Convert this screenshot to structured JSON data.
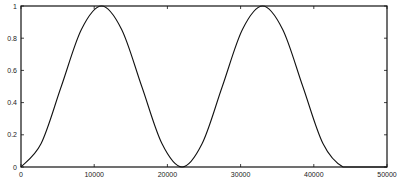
{
  "chart_data": {
    "type": "line",
    "title": "",
    "xlabel": "",
    "ylabel": "",
    "xlim": [
      0,
      50000
    ],
    "ylim": [
      0,
      1
    ],
    "grid": false,
    "legend": null,
    "x_ticks": [
      0,
      10000,
      20000,
      30000,
      40000,
      50000
    ],
    "x_tick_labels": [
      "0",
      "10000",
      "20000",
      "30000",
      "40000",
      "50000"
    ],
    "y_ticks": [
      0,
      0.2,
      0.4,
      0.6,
      0.8,
      1
    ],
    "y_tick_labels": [
      "0",
      "0.2",
      "0.4",
      "0.6",
      "0.8",
      "1"
    ],
    "series": [
      {
        "name": "signal",
        "description": "Raised-cosine (sin^2) pulse train, period ~22000, two full cycles then zero",
        "x": [
          0,
          2750,
          5500,
          8250,
          11000,
          13750,
          16500,
          19250,
          22000,
          24750,
          27500,
          30250,
          33000,
          35750,
          38500,
          41250,
          44000,
          47000,
          50000
        ],
        "y": [
          0,
          0.146,
          0.5,
          0.854,
          1,
          0.854,
          0.5,
          0.146,
          0,
          0.146,
          0.5,
          0.854,
          1,
          0.854,
          0.5,
          0.146,
          0,
          0,
          0
        ]
      }
    ],
    "line_color": "#111111",
    "background": "#ffffff"
  },
  "plot_area": {
    "left": 21,
    "top": 6,
    "right": 387,
    "bottom": 167
  }
}
